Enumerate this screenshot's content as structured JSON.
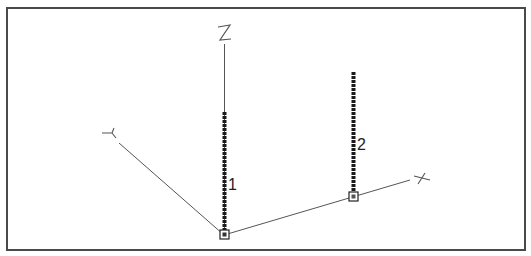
{
  "diagram": {
    "type": "3d-structural-model-view",
    "axes": [
      {
        "name": "X",
        "label": "X"
      },
      {
        "name": "Y",
        "label": "Y"
      },
      {
        "name": "Z",
        "label": "Z"
      }
    ],
    "members": [
      {
        "id": "1",
        "label": "1",
        "orientation": "vertical",
        "line_style": "dotted-heavy"
      },
      {
        "id": "2",
        "label": "2",
        "orientation": "vertical",
        "line_style": "dotted-heavy"
      }
    ],
    "nodes": [
      {
        "id": "origin-node",
        "marker": "square"
      },
      {
        "id": "x-node",
        "marker": "square"
      }
    ],
    "colors": {
      "frame": "#4a4a4a",
      "axis": "#555555",
      "member": "#1a1a1a",
      "background": "#ffffff"
    }
  }
}
